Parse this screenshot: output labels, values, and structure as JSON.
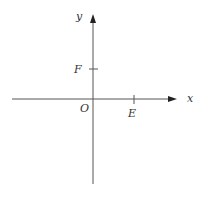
{
  "diagram": {
    "type": "coordinate-axes",
    "axes": {
      "x_label": "x",
      "y_label": "y",
      "origin_label": "O"
    },
    "points": [
      {
        "label": "F",
        "on_axis": "y",
        "position": "positive"
      },
      {
        "label": "E",
        "on_axis": "x",
        "position": "positive"
      }
    ],
    "colors": {
      "axis": "#555555",
      "text": "#333333",
      "background": "#ffffff"
    }
  }
}
